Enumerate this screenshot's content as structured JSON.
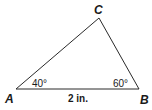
{
  "diagram": {
    "type": "triangle",
    "vertices": {
      "A": {
        "label": "A",
        "x": 16,
        "y": 89
      },
      "B": {
        "label": "B",
        "x": 139,
        "y": 89
      },
      "C": {
        "label": "C",
        "x": 99,
        "y": 18
      }
    },
    "angles": {
      "A": "40°",
      "B": "60°"
    },
    "sides": {
      "AB": "2 in."
    },
    "stroke_color": "#2a2a2a"
  }
}
